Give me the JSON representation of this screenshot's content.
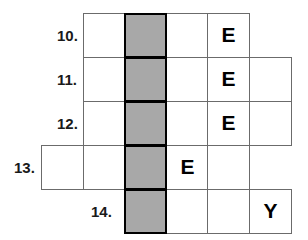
{
  "puzzle": {
    "type": "crossword-grid",
    "colors": {
      "shaded_cell": "#a8a8a8",
      "cell_background": "#ffffff",
      "grid_line": "#6b6b6b",
      "highlight_border": "#000000",
      "letter": "#000000",
      "page_background": "#ffffff"
    },
    "geometry": {
      "column_edges_px": [
        41,
        83,
        124,
        166,
        207,
        249,
        288
      ],
      "row_edges_px": [
        13,
        57,
        101,
        145,
        189,
        233
      ],
      "cell_width_px": 42,
      "cell_height_px": 44,
      "shaded_column_index": 2
    },
    "clue_numbers": [
      {
        "id": "clue-10",
        "label": "10.",
        "x": 57,
        "y": 28
      },
      {
        "id": "clue-11",
        "label": "11.",
        "x": 57,
        "y": 72
      },
      {
        "id": "clue-12",
        "label": "12.",
        "x": 57,
        "y": 116
      },
      {
        "id": "clue-13",
        "label": "13.",
        "x": 14,
        "y": 160
      },
      {
        "id": "clue-14",
        "label": "14.",
        "x": 91,
        "y": 204
      }
    ],
    "rows": [
      {
        "id": "row-10",
        "number": "10.",
        "y": 13,
        "cells": [
          {
            "id": "r10c1",
            "x": 83,
            "letter": "",
            "shaded": false
          },
          {
            "id": "r10c2",
            "x": 124,
            "letter": "",
            "shaded": true
          },
          {
            "id": "r10c3",
            "x": 166,
            "letter": "",
            "shaded": false
          },
          {
            "id": "r10c4",
            "x": 207,
            "letter": "E",
            "shaded": false
          }
        ]
      },
      {
        "id": "row-11",
        "number": "11.",
        "y": 57,
        "cells": [
          {
            "id": "r11c1",
            "x": 83,
            "letter": "",
            "shaded": false
          },
          {
            "id": "r11c2",
            "x": 124,
            "letter": "",
            "shaded": true
          },
          {
            "id": "r11c3",
            "x": 166,
            "letter": "",
            "shaded": false
          },
          {
            "id": "r11c4",
            "x": 207,
            "letter": "E",
            "shaded": false
          },
          {
            "id": "r11c5",
            "x": 249,
            "letter": "",
            "shaded": false
          }
        ]
      },
      {
        "id": "row-12",
        "number": "12.",
        "y": 101,
        "cells": [
          {
            "id": "r12c1",
            "x": 83,
            "letter": "",
            "shaded": false
          },
          {
            "id": "r12c2",
            "x": 124,
            "letter": "",
            "shaded": true
          },
          {
            "id": "r12c3",
            "x": 166,
            "letter": "",
            "shaded": false
          },
          {
            "id": "r12c4",
            "x": 207,
            "letter": "E",
            "shaded": false
          },
          {
            "id": "r12c5",
            "x": 249,
            "letter": "",
            "shaded": false
          }
        ]
      },
      {
        "id": "row-13",
        "number": "13.",
        "y": 145,
        "cells": [
          {
            "id": "r13c0",
            "x": 41,
            "letter": "",
            "shaded": false
          },
          {
            "id": "r13c1",
            "x": 83,
            "letter": "",
            "shaded": false
          },
          {
            "id": "r13c2",
            "x": 124,
            "letter": "",
            "shaded": true
          },
          {
            "id": "r13c3",
            "x": 166,
            "letter": "E",
            "shaded": false
          },
          {
            "id": "r13c4",
            "x": 207,
            "letter": "",
            "shaded": false
          }
        ]
      },
      {
        "id": "row-14",
        "number": "14.",
        "y": 189,
        "cells": [
          {
            "id": "r14c2",
            "x": 124,
            "letter": "",
            "shaded": true
          },
          {
            "id": "r14c3",
            "x": 166,
            "letter": "",
            "shaded": false
          },
          {
            "id": "r14c4",
            "x": 207,
            "letter": "",
            "shaded": false
          },
          {
            "id": "r14c5",
            "x": 249,
            "letter": "Y",
            "shaded": false
          }
        ]
      }
    ]
  }
}
